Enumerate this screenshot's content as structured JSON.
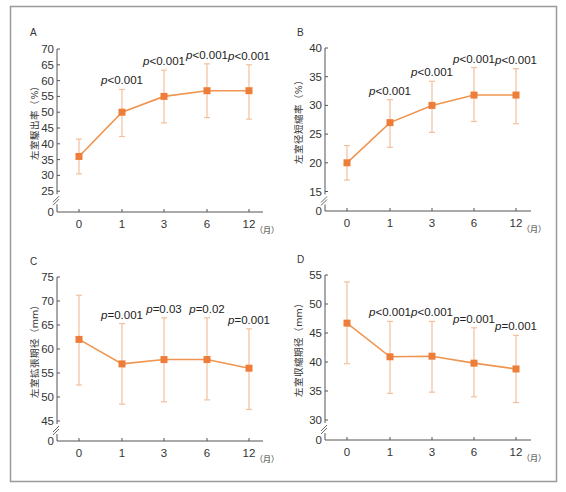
{
  "figure": {
    "frame_color": "#9a9a9a",
    "axis_color": "#555555",
    "line_color": "#f0954f",
    "marker_color": "#ee7d3a",
    "errorbar_color": "#f2c09c",
    "x_unit": "（月）"
  },
  "chart_data": [
    {
      "panel": "A",
      "type": "line",
      "title": "",
      "xlabel": "",
      "x_unit": "（月）",
      "ylabel": "左室駆出率（%）",
      "categories": [
        "0",
        "1",
        "3",
        "6",
        "12"
      ],
      "values": [
        36,
        50,
        55,
        56.8,
        56.8
      ],
      "error_low": [
        30.5,
        42.3,
        46.6,
        48.3,
        47.8
      ],
      "error_high": [
        41.5,
        57.2,
        63.3,
        65.3,
        65.0
      ],
      "p_values": [
        "",
        "p<0.001",
        "p<0.001",
        "p<0.001",
        "p<0.001"
      ],
      "yticks": [
        0,
        25,
        30,
        35,
        40,
        45,
        50,
        55,
        60,
        65,
        70
      ],
      "ylim": [
        25,
        70
      ],
      "axis_break": true,
      "grid": false
    },
    {
      "panel": "B",
      "type": "line",
      "title": "",
      "xlabel": "",
      "x_unit": "（月）",
      "ylabel": "左室径短縮率（%）",
      "categories": [
        "0",
        "1",
        "3",
        "6",
        "12"
      ],
      "values": [
        20,
        27,
        30,
        31.8,
        31.8
      ],
      "error_low": [
        17,
        22.7,
        25.3,
        27.2,
        26.8
      ],
      "error_high": [
        23,
        31,
        34.2,
        36.6,
        36.4
      ],
      "p_values": [
        "",
        "p<0.001",
        "p<0.001",
        "p<0.001",
        "p<0.001"
      ],
      "yticks": [
        0,
        15,
        20,
        25,
        30,
        35,
        40
      ],
      "ylim": [
        15,
        40
      ],
      "axis_break": true,
      "grid": false
    },
    {
      "panel": "C",
      "type": "line",
      "title": "",
      "xlabel": "",
      "x_unit": "（月）",
      "ylabel": "左室拡張期径（mm）",
      "categories": [
        "0",
        "1",
        "3",
        "6",
        "12"
      ],
      "values": [
        62,
        56.9,
        57.8,
        57.8,
        56
      ],
      "error_low": [
        52.5,
        48.5,
        49,
        49.4,
        47.4
      ],
      "error_high": [
        71.2,
        65.3,
        66.5,
        66.5,
        64.2
      ],
      "p_values": [
        "",
        "p=0.001",
        "p=0.03",
        "p=0.02",
        "p=0.001"
      ],
      "yticks": [
        0,
        45,
        50,
        55,
        60,
        65,
        70,
        75
      ],
      "ylim": [
        45,
        75
      ],
      "axis_break": true,
      "grid": false
    },
    {
      "panel": "D",
      "type": "line",
      "title": "",
      "xlabel": "",
      "x_unit": "（月）",
      "ylabel": "左室収縮期径（mm）",
      "categories": [
        "0",
        "1",
        "3",
        "6",
        "12"
      ],
      "values": [
        46.7,
        40.9,
        41,
        39.8,
        38.8
      ],
      "error_low": [
        39.7,
        34.6,
        34.8,
        34,
        33
      ],
      "error_high": [
        53.8,
        47,
        47,
        45.9,
        44.6
      ],
      "p_values": [
        "",
        "p<0.001",
        "p<0.001",
        "p=0.001",
        "p=0.001"
      ],
      "yticks": [
        0,
        30,
        35,
        40,
        45,
        50,
        55
      ],
      "ylim": [
        30,
        55
      ],
      "axis_break": true,
      "grid": false
    }
  ],
  "layout": [
    {
      "axisX": 57,
      "axisEnd": 263,
      "xAxisY": 212,
      "yTopVal": 70,
      "yTopPx": 49,
      "pxPerUnit": 3.16,
      "xs": [
        79,
        122,
        164,
        207,
        249
      ],
      "letterX": 30,
      "letterY": 36,
      "ylabX": 38
    },
    {
      "axisX": 325,
      "axisEnd": 531,
      "xAxisY": 211,
      "yTopVal": 40,
      "yTopPx": 48,
      "pxPerUnit": 5.74,
      "xs": [
        347,
        390,
        432,
        474,
        516
      ],
      "letterX": 297,
      "letterY": 36,
      "ylabX": 302
    },
    {
      "axisX": 57,
      "axisEnd": 263,
      "xAxisY": 441,
      "yTopVal": 75,
      "yTopPx": 277,
      "pxPerUnit": 4.8,
      "xs": [
        79,
        122,
        164,
        207,
        249
      ],
      "letterX": 30,
      "letterY": 265,
      "ylabX": 38
    },
    {
      "axisX": 325,
      "axisEnd": 531,
      "xAxisY": 440,
      "yTopVal": 55,
      "yTopPx": 275,
      "pxPerUnit": 5.8,
      "xs": [
        347,
        390,
        432,
        474,
        516
      ],
      "letterX": 297,
      "letterY": 263,
      "ylabX": 302
    }
  ]
}
